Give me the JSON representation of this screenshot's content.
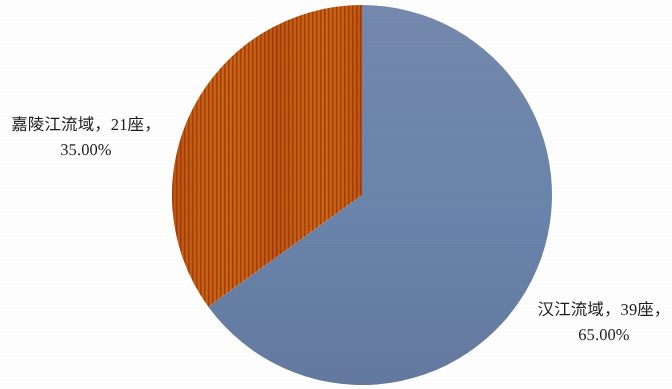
{
  "background_color": "#ffffff",
  "chart_data": {
    "type": "pie",
    "title": "",
    "subtitle": "",
    "xlabel": "",
    "ylabel": "",
    "legend_position": "none",
    "grid": false,
    "start_angle_deg": 0,
    "direction": "clockwise",
    "categories": [
      "汉江流域",
      "嘉陵江流域"
    ],
    "values": [
      39,
      21
    ],
    "percentages": [
      65.0,
      35.0
    ],
    "total": 60,
    "unit": "座",
    "slices": [
      {
        "name": "汉江流域",
        "count": 39,
        "unit": "座",
        "percent": 65.0,
        "percent_label": "65.00%",
        "color": "#6b84ab",
        "fill_style": "solid",
        "start_angle_deg": 0,
        "sweep_angle_deg": 234
      },
      {
        "name": "嘉陵江流域",
        "count": 21,
        "unit": "座",
        "percent": 35.0,
        "percent_label": "35.00%",
        "color": "#b8400d",
        "color_secondary": "#c96812",
        "fill_style": "vertical-stripes",
        "start_angle_deg": 234,
        "sweep_angle_deg": 126
      }
    ],
    "geometry": {
      "center_x": 362,
      "center_y": 195,
      "radius": 190
    }
  },
  "labels": {
    "jialingjiang": {
      "name": "嘉陵江流域",
      "line1": "嘉陵江流域，21座，",
      "line2": "35.00%"
    },
    "hanjiang": {
      "name": "汉江流域",
      "line1": "汉江流域，39座，",
      "line2": "65.00%"
    }
  }
}
